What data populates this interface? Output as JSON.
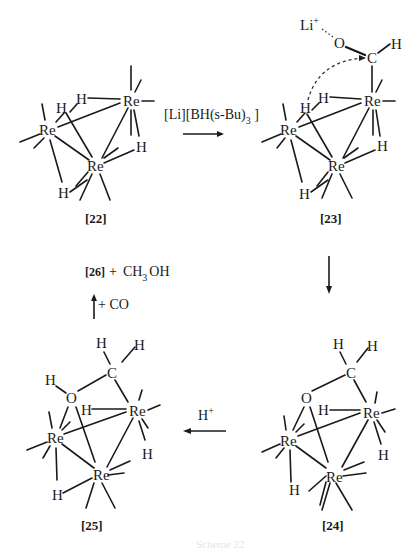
{
  "diagram": {
    "type": "reaction_scheme",
    "compounds": [
      {
        "id": "22",
        "label": "[22]",
        "atoms": [
          "Re",
          "Re",
          "Re",
          "H",
          "H",
          "H",
          "H"
        ]
      },
      {
        "id": "23",
        "label": "[23]",
        "atoms": [
          "Li+",
          "O",
          "C",
          "H",
          "Re",
          "Re",
          "Re",
          "H",
          "H",
          "H",
          "H"
        ]
      },
      {
        "id": "24",
        "label": "[24]",
        "atoms": [
          "H",
          "H",
          "C",
          "O",
          "Re",
          "Re",
          "Re",
          "H",
          "H",
          "H"
        ]
      },
      {
        "id": "25",
        "label": "[25]",
        "atoms": [
          "H",
          "H",
          "C",
          "H",
          "O",
          "Re",
          "Re",
          "Re",
          "H",
          "H",
          "H"
        ]
      }
    ],
    "steps": [
      {
        "from": "22",
        "to": "23",
        "reagent": "[Li][BH(s-Bu)3 ]",
        "direction": "right"
      },
      {
        "from": "23",
        "to": "24",
        "reagent": "",
        "direction": "down"
      },
      {
        "from": "24",
        "to": "25",
        "reagent": "H+",
        "direction": "left"
      },
      {
        "from": "25",
        "to": "26 + CH3OH",
        "reagent": "+ CO",
        "direction": "up"
      }
    ]
  },
  "labels": {
    "c22": "[22]",
    "c23": "[23]",
    "c24": "[24]",
    "c25": "[25]"
  },
  "atoms": {
    "re": "Re",
    "h": "H",
    "c": "C",
    "o": "O",
    "li": "Li",
    "li_charge": "+"
  },
  "reagents": {
    "step1_main": "[Li][BH(s-Bu)",
    "step1_sub": "3",
    "step1_tail": " ]",
    "step3_main": "H",
    "step3_sup": "+",
    "step4": "+ CO"
  },
  "products": {
    "compound": "[26]",
    "plus": "+",
    "methanol_main": "CH",
    "methanol_sub": "3",
    "methanol_tail": "OH"
  },
  "caption": {
    "text": "Scheme 22"
  }
}
